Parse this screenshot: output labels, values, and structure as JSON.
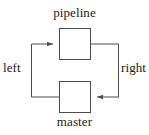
{
  "diagram": {
    "type": "flow-loop",
    "background_color": "#ffffff",
    "stroke_color": "#4d4d4d",
    "text_color": "#1a1a1a",
    "nodes": [
      {
        "id": "pipeline",
        "label": "pipeline",
        "label_position": "above",
        "shape": "square",
        "x": 59,
        "y": 28,
        "width": 31,
        "height": 31
      },
      {
        "id": "master",
        "label": "master",
        "label_position": "below",
        "shape": "square",
        "x": 59,
        "y": 81,
        "width": 31,
        "height": 31
      }
    ],
    "edges": [
      {
        "id": "left-edge",
        "label": "left",
        "label_position": "left",
        "from": "master",
        "to": "pipeline",
        "arrowhead": "pipeline-left-side",
        "direction": "up-then-right"
      },
      {
        "id": "right-edge",
        "label": "right",
        "label_position": "right",
        "from": "pipeline",
        "to": "master",
        "arrowhead": "master-right-side",
        "direction": "down-then-left"
      }
    ]
  }
}
